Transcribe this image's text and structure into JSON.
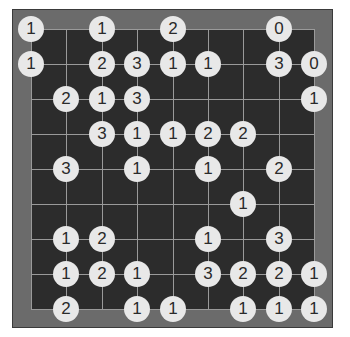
{
  "puzzle": {
    "type": "hashi",
    "cols": 9,
    "rows": 9,
    "colors": {
      "frame": "#6b6b6b",
      "board": "#2c2c2c",
      "grid_line": "#9a9a9a",
      "island": "#e8e8e8",
      "island_text": "#2a2a2a"
    },
    "islands": [
      {
        "r": 0,
        "c": 0,
        "v": "1"
      },
      {
        "r": 0,
        "c": 2,
        "v": "1"
      },
      {
        "r": 0,
        "c": 4,
        "v": "2"
      },
      {
        "r": 0,
        "c": 7,
        "v": "0"
      },
      {
        "r": 1,
        "c": 0,
        "v": "1"
      },
      {
        "r": 1,
        "c": 2,
        "v": "2"
      },
      {
        "r": 1,
        "c": 3,
        "v": "3"
      },
      {
        "r": 1,
        "c": 4,
        "v": "1"
      },
      {
        "r": 1,
        "c": 5,
        "v": "1"
      },
      {
        "r": 1,
        "c": 7,
        "v": "3"
      },
      {
        "r": 1,
        "c": 8,
        "v": "0"
      },
      {
        "r": 2,
        "c": 1,
        "v": "2"
      },
      {
        "r": 2,
        "c": 2,
        "v": "1"
      },
      {
        "r": 2,
        "c": 3,
        "v": "3"
      },
      {
        "r": 2,
        "c": 8,
        "v": "1"
      },
      {
        "r": 3,
        "c": 2,
        "v": "3"
      },
      {
        "r": 3,
        "c": 3,
        "v": "1"
      },
      {
        "r": 3,
        "c": 4,
        "v": "1"
      },
      {
        "r": 3,
        "c": 5,
        "v": "2"
      },
      {
        "r": 3,
        "c": 6,
        "v": "2"
      },
      {
        "r": 4,
        "c": 1,
        "v": "3"
      },
      {
        "r": 4,
        "c": 3,
        "v": "1"
      },
      {
        "r": 4,
        "c": 5,
        "v": "1"
      },
      {
        "r": 4,
        "c": 7,
        "v": "2"
      },
      {
        "r": 5,
        "c": 6,
        "v": "1"
      },
      {
        "r": 6,
        "c": 1,
        "v": "1"
      },
      {
        "r": 6,
        "c": 2,
        "v": "2"
      },
      {
        "r": 6,
        "c": 5,
        "v": "1"
      },
      {
        "r": 6,
        "c": 7,
        "v": "3"
      },
      {
        "r": 7,
        "c": 1,
        "v": "1"
      },
      {
        "r": 7,
        "c": 2,
        "v": "2"
      },
      {
        "r": 7,
        "c": 3,
        "v": "1"
      },
      {
        "r": 7,
        "c": 5,
        "v": "3"
      },
      {
        "r": 7,
        "c": 6,
        "v": "2"
      },
      {
        "r": 7,
        "c": 7,
        "v": "2"
      },
      {
        "r": 7,
        "c": 8,
        "v": "1"
      },
      {
        "r": 8,
        "c": 1,
        "v": "2"
      },
      {
        "r": 8,
        "c": 3,
        "v": "1"
      },
      {
        "r": 8,
        "c": 4,
        "v": "1"
      },
      {
        "r": 8,
        "c": 6,
        "v": "1"
      },
      {
        "r": 8,
        "c": 7,
        "v": "1"
      },
      {
        "r": 8,
        "c": 8,
        "v": "1"
      }
    ]
  }
}
